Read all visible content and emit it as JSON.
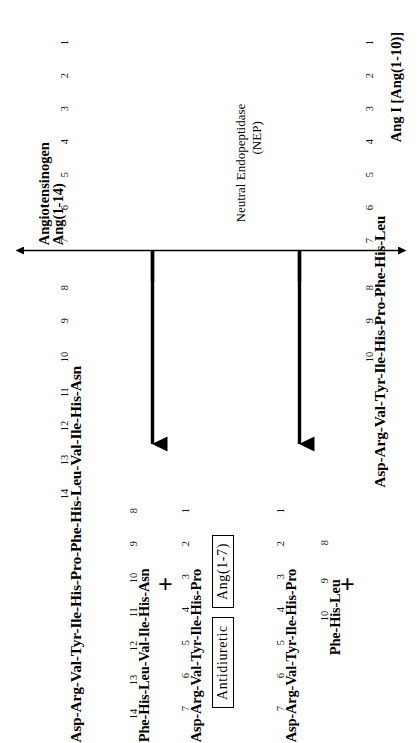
{
  "figure": {
    "background_color": "#ffffff",
    "ink_color": "#000000"
  },
  "top_left_substrate": {
    "name_line1": "Angiotensinogen",
    "name_line2": "Ang(1-14)",
    "sequence": "Asp-Arg-Val-Tyr-Ile-His-Pro-Phe-His-Leu-Val-Ile-His-Asn",
    "residue_numbers": [
      "1",
      "2",
      "3",
      "4",
      "5",
      "6",
      "7",
      "8",
      "9",
      "10",
      "11",
      "12",
      "13",
      "14"
    ]
  },
  "top_right_substrate": {
    "name": "Ang I [Ang(1-10)]",
    "sequence": "Asp-Arg-Val-Tyr-Ile-His-Pro-Phe-His-Leu",
    "residue_numbers": [
      "1",
      "2",
      "3",
      "4",
      "5",
      "6",
      "7",
      "8",
      "9",
      "10"
    ]
  },
  "enzyme": {
    "name_line1": "Neutral Endopeptidase",
    "name_line2": "(NEP)"
  },
  "products_left": {
    "fragment_a": {
      "sequence": "Asp-Arg-Val-Tyr-Ile-His-Pro",
      "residue_numbers": [
        "1",
        "2",
        "3",
        "4",
        "5",
        "6",
        "7"
      ]
    },
    "operator": "+",
    "fragment_b": {
      "sequence": "Phe-His-Leu-Val-Ile-His-Asn",
      "residue_numbers": [
        "8",
        "9",
        "10",
        "11",
        "12",
        "13",
        "14"
      ]
    }
  },
  "products_right": {
    "fragment_a": {
      "sequence": "Asp-Arg-Val-Tyr-Ile-His-Pro",
      "residue_numbers": [
        "1",
        "2",
        "3",
        "4",
        "5",
        "6",
        "7"
      ]
    },
    "operator": "+",
    "fragment_b": {
      "sequence": "Phe-His-Leu",
      "residue_numbers": [
        "8",
        "9",
        "10"
      ]
    }
  },
  "annotations": {
    "product_name_box": "Ang(1-7)",
    "activity_box": "Antidiuretic"
  },
  "axis": {
    "type": "double-headed-horizontal-arrow",
    "cleavage_tick_count": 2
  }
}
